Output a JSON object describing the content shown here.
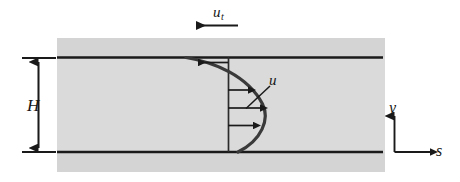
{
  "figure": {
    "type": "technical-diagram",
    "labels": {
      "top_wall_velocity": "u",
      "top_wall_velocity_subscript": "t",
      "channel_height": "H",
      "velocity_profile": "u",
      "axis_vertical": "y",
      "axis_horizontal": "s"
    },
    "colors": {
      "background": "#ffffff",
      "fluid_fill": "#dcdcdc",
      "wall_band": "#d2d2d2",
      "line": "#1a1a1a",
      "curve": "#3d3d3d"
    },
    "geometry": {
      "band_left_x": 57,
      "band_right_x": 385,
      "band_top_y": 38,
      "band_bottom_y": 172,
      "top_wall_y": 57,
      "bottom_wall_y": 152,
      "profile_baseline_x": 228,
      "channel_height_px": 95,
      "axes_origin_x": 394,
      "axes_origin_y": 152
    },
    "velocity_arrows": [
      {
        "y": 62,
        "direction": "left",
        "tip_x": 195,
        "tail_x": 228
      },
      {
        "y": 90,
        "direction": "right",
        "tail_x": 228,
        "tip_x": 251
      },
      {
        "y": 108,
        "direction": "right",
        "tail_x": 228,
        "tip_x": 263
      },
      {
        "y": 125,
        "direction": "right",
        "tail_x": 228,
        "tip_x": 256
      }
    ]
  }
}
